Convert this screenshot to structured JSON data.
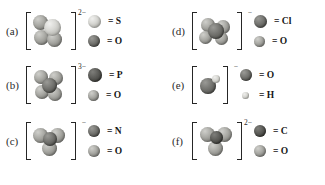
{
  "figure": {
    "background": "#ffffff",
    "panels": [
      {
        "label": "(a)",
        "charge": "2−",
        "legend": [
          {
            "symbol": "= S",
            "shade": "light",
            "size": 13
          },
          {
            "symbol": "= O",
            "shade": "dark",
            "size": 12
          }
        ]
      },
      {
        "label": "(b)",
        "charge": "3−",
        "legend": [
          {
            "symbol": "= P",
            "shade": "darker",
            "size": 14
          },
          {
            "symbol": "= O",
            "shade": "mid",
            "size": 11
          }
        ]
      },
      {
        "label": "(c)",
        "charge": "−",
        "legend": [
          {
            "symbol": "= N",
            "shade": "dark",
            "size": 12
          },
          {
            "symbol": "= O",
            "shade": "mid",
            "size": 12
          }
        ]
      },
      {
        "label": "(d)",
        "charge": "−",
        "legend": [
          {
            "symbol": "= Cl",
            "shade": "dark",
            "size": 13
          },
          {
            "symbol": "= O",
            "shade": "mid",
            "size": 11
          }
        ]
      },
      {
        "label": "(e)",
        "charge": "−",
        "legend": [
          {
            "symbol": "= O",
            "shade": "dark",
            "size": 12
          },
          {
            "symbol": "= H",
            "shade": "tiny",
            "size": 7
          }
        ]
      },
      {
        "label": "(f)",
        "charge": "2−",
        "legend": [
          {
            "symbol": "= C",
            "shade": "darker",
            "size": 12
          },
          {
            "symbol": "= O",
            "shade": "mid",
            "size": 12
          }
        ]
      }
    ]
  }
}
